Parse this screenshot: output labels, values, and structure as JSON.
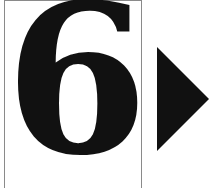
{
  "card": {
    "number": "6"
  },
  "next_button": {
    "icon": "play-triangle-right-icon",
    "color": "#111111"
  }
}
